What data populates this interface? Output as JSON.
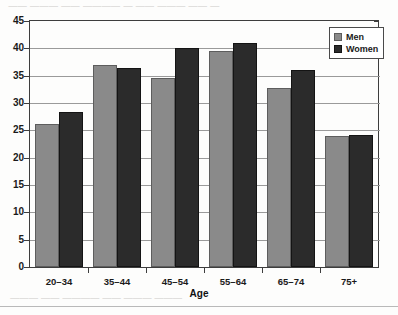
{
  "chart_data": {
    "type": "bar",
    "title": "",
    "xlabel": "Age",
    "ylabel": "",
    "ylim": [
      0,
      45
    ],
    "ytick_step": 5,
    "yticks": [
      45,
      40,
      35,
      30,
      25,
      20,
      15,
      10,
      5,
      0
    ],
    "grid": true,
    "legend_position": "top-right",
    "categories": [
      "20–34",
      "35–44",
      "45–54",
      "55–64",
      "65–74",
      "75+"
    ],
    "series": [
      {
        "name": "Men",
        "color": "#8a8a8a",
        "values": [
          26.2,
          36.9,
          34.5,
          39.5,
          32.8,
          23.9
        ]
      },
      {
        "name": "Women",
        "color": "#2b2b2b",
        "values": [
          28.4,
          36.4,
          40.0,
          41.0,
          36.0,
          24.1
        ]
      }
    ]
  },
  "legend": {
    "items": [
      {
        "label": "Men",
        "swatch": "men"
      },
      {
        "label": "Women",
        "swatch": "women"
      }
    ]
  },
  "artifacts": {
    "top_bleed_text": "— —— ——— —— — ———— —— ——— ——",
    "bottom_bleed_text": "——— ——— —— ———— —— ———"
  }
}
